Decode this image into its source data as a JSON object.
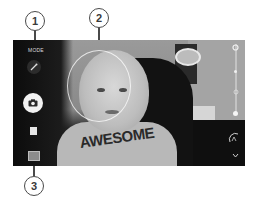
{
  "viewfinder": {
    "mode_label": "MODE",
    "shirt_text": "AWESOME"
  },
  "left_controls": {
    "mode_button": "MODE",
    "effects_icon": "magic-wand-icon",
    "shutter_icon": "camera-icon",
    "video_icon": "video-icon",
    "gallery_icon": "gallery-thumbnail"
  },
  "right_controls": {
    "items": [
      {
        "icon": "settings-icon"
      },
      {
        "icon": "flash-icon"
      },
      {
        "icon": "timer-icon"
      },
      {
        "icon": "switch-camera-icon"
      },
      {
        "icon": "hdr-icon"
      },
      {
        "icon": "chevron-down-icon"
      }
    ]
  },
  "callouts": [
    {
      "number": "1"
    },
    {
      "number": "2"
    },
    {
      "number": "3"
    }
  ],
  "colors": {
    "callout_stroke": "#4a4a4a",
    "shutter": "#f2f2f2",
    "frame": "#1a1a1a"
  }
}
